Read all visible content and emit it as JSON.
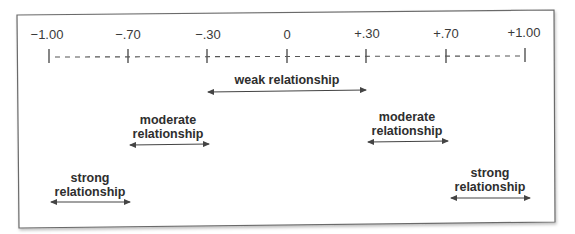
{
  "diagram": {
    "type": "correlation-strength-scale",
    "scale": {
      "ticks": [
        {
          "value": -1.0,
          "label": "−1.00"
        },
        {
          "value": -0.7,
          "label": "−.70"
        },
        {
          "value": -0.3,
          "label": "−.30"
        },
        {
          "value": 0,
          "label": "0"
        },
        {
          "value": 0.3,
          "label": "+.30"
        },
        {
          "value": 0.7,
          "label": "+.70"
        },
        {
          "value": 1.0,
          "label": "+1.00"
        }
      ],
      "line_style": "dashed"
    },
    "ranges": [
      {
        "id": "weak",
        "label": "weak relationship",
        "line1": "weak relationship",
        "line2": "",
        "from": -0.3,
        "to": 0.3
      },
      {
        "id": "moderate-negative",
        "label": "moderate relationship",
        "line1": "moderate",
        "line2": "relationship",
        "from": -0.7,
        "to": -0.3
      },
      {
        "id": "moderate-positive",
        "label": "moderate relationship",
        "line1": "moderate",
        "line2": "relationship",
        "from": 0.3,
        "to": 0.7
      },
      {
        "id": "strong-negative",
        "label": "strong relationship",
        "line1": "strong",
        "line2": "relationship",
        "from": -1.0,
        "to": -0.7
      },
      {
        "id": "strong-positive",
        "label": "strong relationship",
        "line1": "strong",
        "line2": "relationship",
        "from": 0.7,
        "to": 1.0
      }
    ],
    "colors": {
      "border": "#6a6a6a",
      "text": "#333333",
      "line": "#444444"
    }
  }
}
